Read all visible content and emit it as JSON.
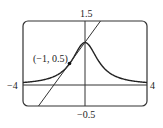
{
  "chart_data": {
    "type": "line",
    "title": "",
    "xlabel": "",
    "ylabel": "",
    "xlim": [
      -4,
      4
    ],
    "ylim": [
      -0.5,
      1.5
    ],
    "grid": false,
    "series": [
      {
        "name": "curve y = 1/(1+x^2)",
        "x": [
          -4,
          -3,
          -2,
          -1.5,
          -1,
          -0.5,
          0,
          0.5,
          1,
          1.5,
          2,
          3,
          4
        ],
        "values": [
          0.059,
          0.1,
          0.2,
          0.308,
          0.5,
          0.8,
          1,
          0.8,
          0.5,
          0.308,
          0.2,
          0.1,
          0.059
        ]
      },
      {
        "name": "tangent line y = 0.5x + 1",
        "x": [
          -3,
          1
        ],
        "values": [
          -0.5,
          1.5
        ]
      }
    ],
    "annotations": [
      {
        "text": "(−1, 0.5)",
        "x": -1,
        "y": 0.5
      }
    ],
    "tick_labels": {
      "x_min": "−4",
      "x_max": "4",
      "y_max": "1.5",
      "y_min": "−0.5"
    }
  },
  "labels": {
    "ymax": "1.5",
    "ymin": "−0.5",
    "xmin": "−4",
    "xmax": "4",
    "point": "(−1, 0.5)"
  }
}
